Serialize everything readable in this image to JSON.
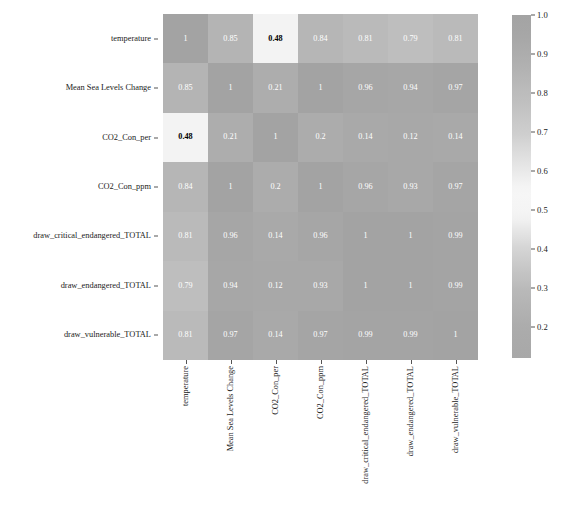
{
  "chart_data": {
    "type": "heatmap",
    "title": "",
    "xlabel": "",
    "ylabel": "",
    "grid": false,
    "legend_position": "right",
    "colorbar": {
      "label": "",
      "ticks": [
        1.0,
        0.9,
        0.8,
        0.7,
        0.6,
        0.5,
        0.4,
        0.3,
        0.2
      ],
      "tick_labels": [
        "1.0",
        "0.9",
        "0.8",
        "0.7",
        "0.6",
        "0.5",
        "0.4",
        "0.3",
        "0.2"
      ],
      "vmin": 0.12,
      "vmax": 1.0,
      "colormap": "diverging-gray"
    },
    "categories": [
      "temperature",
      "Mean Sea Levels Change",
      "CO2_Con_per",
      "CO2_Con_ppm",
      "draw_critical_endangered_TOTAL",
      "draw_endangered_TOTAL",
      "draw_vulnerable_TOTAL"
    ],
    "x_tick_labels": [
      "temperature",
      "Mean Sea Levels Change",
      "CO2_Con_per",
      "CO2_Con_ppm",
      "draw_critical_endangered_TOTAL",
      "draw_endangered_TOTAL",
      "draw_vulnerable_TOTAL"
    ],
    "y_tick_labels": [
      "temperature",
      "Mean Sea Levels Change",
      "CO2_Con_per",
      "CO2_Con_ppm",
      "draw_critical_endangered_TOTAL",
      "draw_endangered_TOTAL",
      "draw_vulnerable_TOTAL"
    ],
    "values": [
      [
        1,
        0.85,
        0.48,
        0.84,
        0.81,
        0.79,
        0.81
      ],
      [
        0.85,
        1,
        0.21,
        1,
        0.96,
        0.94,
        0.97
      ],
      [
        0.48,
        0.21,
        1,
        0.2,
        0.14,
        0.12,
        0.14
      ],
      [
        0.84,
        1,
        0.2,
        1,
        0.96,
        0.93,
        0.97
      ],
      [
        0.81,
        0.96,
        0.14,
        0.96,
        1,
        1,
        0.99
      ],
      [
        0.79,
        0.94,
        0.12,
        0.93,
        1,
        1,
        0.99
      ],
      [
        0.81,
        0.97,
        0.14,
        0.97,
        0.99,
        0.99,
        1
      ]
    ],
    "annotations": [
      [
        "1",
        "0.85",
        "0.48",
        "0.84",
        "0.81",
        "0.79",
        "0.81"
      ],
      [
        "0.85",
        "1",
        "0.21",
        "1",
        "0.96",
        "0.94",
        "0.97"
      ],
      [
        "0.48",
        "0.21",
        "1",
        "0.2",
        "0.14",
        "0.12",
        "0.14"
      ],
      [
        "0.84",
        "1",
        "0.2",
        "1",
        "0.96",
        "0.93",
        "0.97"
      ],
      [
        "0.81",
        "0.96",
        "0.14",
        "0.96",
        "1",
        "1",
        "0.99"
      ],
      [
        "0.79",
        "0.94",
        "0.12",
        "0.93",
        "1",
        "1",
        "0.99"
      ],
      [
        "0.81",
        "0.97",
        "0.14",
        "0.97",
        "0.99",
        "0.99",
        "1"
      ]
    ]
  },
  "colors": {
    "text": "#1a1a1a",
    "annotation_light": "#ffffff",
    "annotation_dark": "#000000",
    "tick": "#555555",
    "background": "#ffffff"
  },
  "caption": ""
}
